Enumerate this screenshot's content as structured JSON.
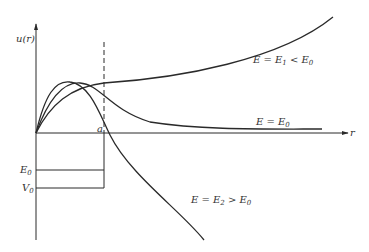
{
  "diagram": {
    "type": "physics-wavefunction-plot",
    "y_axis_label": "u(r)",
    "x_axis_label": "r",
    "well_edge_label": "a",
    "levels": [
      {
        "name": "E0",
        "label": "E",
        "sub": "0"
      },
      {
        "name": "V0",
        "label": "V",
        "sub": "0"
      }
    ],
    "curves": [
      {
        "id": "E1",
        "label": "E = E",
        "sub1": "1",
        "rel": " < E",
        "sub2": "0",
        "behavior": "grows exponentially"
      },
      {
        "id": "E0",
        "label": "E = E",
        "sub1": "0",
        "behavior": "decays to constant"
      },
      {
        "id": "E2",
        "label": "E = E",
        "sub1": "2",
        "rel": " > E",
        "sub2": "0",
        "behavior": "crosses zero and diverges negative"
      }
    ],
    "colors": {
      "line": "#2a2a2a",
      "text": "#333333",
      "background": "#ffffff"
    }
  }
}
